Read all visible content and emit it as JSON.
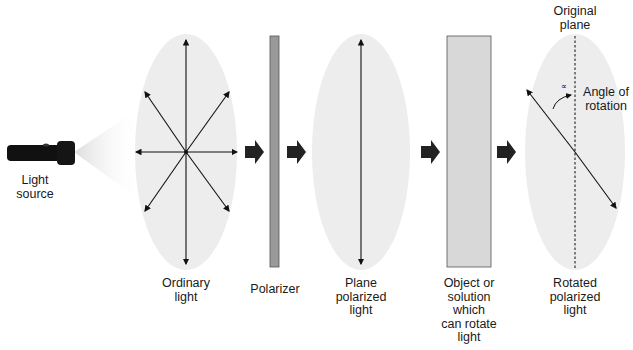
{
  "diagram": {
    "stages": [
      {
        "id": "source",
        "label": "Light\nsource"
      },
      {
        "id": "ordinary",
        "label": "Ordinary\nlight"
      },
      {
        "id": "polarizer",
        "label": "Polarizer"
      },
      {
        "id": "plane",
        "label": "Plane\npolarized\nlight"
      },
      {
        "id": "object",
        "label": "Object or\nsolution\nwhich\ncan rotate\nlight"
      },
      {
        "id": "rotated",
        "label": "Rotated\npolarized\nlight"
      }
    ],
    "annotations": {
      "original_plane": "Original\nplane",
      "angle_of_rotation": "Angle of\nrotation",
      "alpha_symbol": "∝"
    },
    "colors": {
      "ellipse_fill": "#ededed",
      "polarizer_fill": "#9a9a9a",
      "object_fill": "#d8d8d8",
      "arrow": "#222222"
    }
  }
}
